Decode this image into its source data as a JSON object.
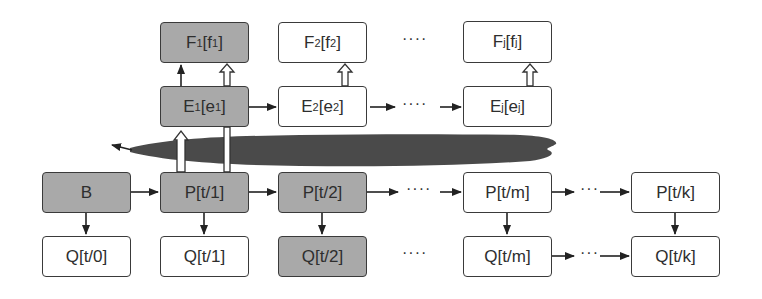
{
  "diagram": {
    "colors": {
      "filled": "#a9a9a9",
      "empty": "#ffffff",
      "border": "#3a3a3a",
      "cloud": "#4a4a4a"
    },
    "nodes": {
      "F1": {
        "main": "F",
        "sub": "1",
        "br_main": "f",
        "br_sub": "1",
        "filled": true
      },
      "F2": {
        "main": "F",
        "sub": "2",
        "br_main": "f",
        "br_sub": "2",
        "filled": false
      },
      "Fj": {
        "main": "F",
        "sub": "j",
        "br_main": "f",
        "br_sub": "j",
        "filled": false
      },
      "E1": {
        "main": "E",
        "sub": "1",
        "br_main": "e",
        "br_sub": "1",
        "filled": true
      },
      "E2": {
        "main": "E",
        "sub": "2",
        "br_main": "e",
        "br_sub": "2",
        "filled": false
      },
      "Ej": {
        "main": "E",
        "sub": "j",
        "br_main": "e",
        "br_sub": "j",
        "filled": false
      },
      "B": {
        "label": "B",
        "filled": true
      },
      "P1": {
        "label": "P[t/1]",
        "filled": true
      },
      "P2": {
        "label": "P[t/2]",
        "filled": true
      },
      "Pm": {
        "label": "P[t/m]",
        "filled": false
      },
      "Pk": {
        "label": "P[t/k]",
        "filled": false
      },
      "Q0": {
        "label": "Q[t/0]",
        "filled": false
      },
      "Q1": {
        "label": "Q[t/1]",
        "filled": false
      },
      "Q2": {
        "label": "Q[t/2]",
        "filled": true
      },
      "Qm": {
        "label": "Q[t/m]",
        "filled": false
      },
      "Qk": {
        "label": "Q[t/k]",
        "filled": false
      }
    },
    "ellipsis": {
      "f_row": "····",
      "e_row": "····",
      "p_row_a": "····",
      "p_row_b": "···",
      "q_row_a": "····",
      "q_row_b": "···"
    }
  }
}
